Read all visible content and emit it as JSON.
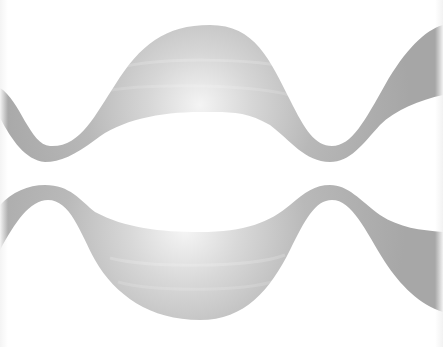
{
  "graphic": {
    "description": "Two wavy gray ribbon bands with soft radial highlights",
    "background_color": "#ffffff",
    "band_color": "#a9a9a9",
    "highlight_color": "#f2f2f2",
    "bands": [
      {
        "name": "top-wave-band",
        "highlight_center": [
          200,
          100
        ]
      },
      {
        "name": "bottom-wave-band",
        "highlight_center": [
          190,
          230
        ]
      }
    ]
  }
}
